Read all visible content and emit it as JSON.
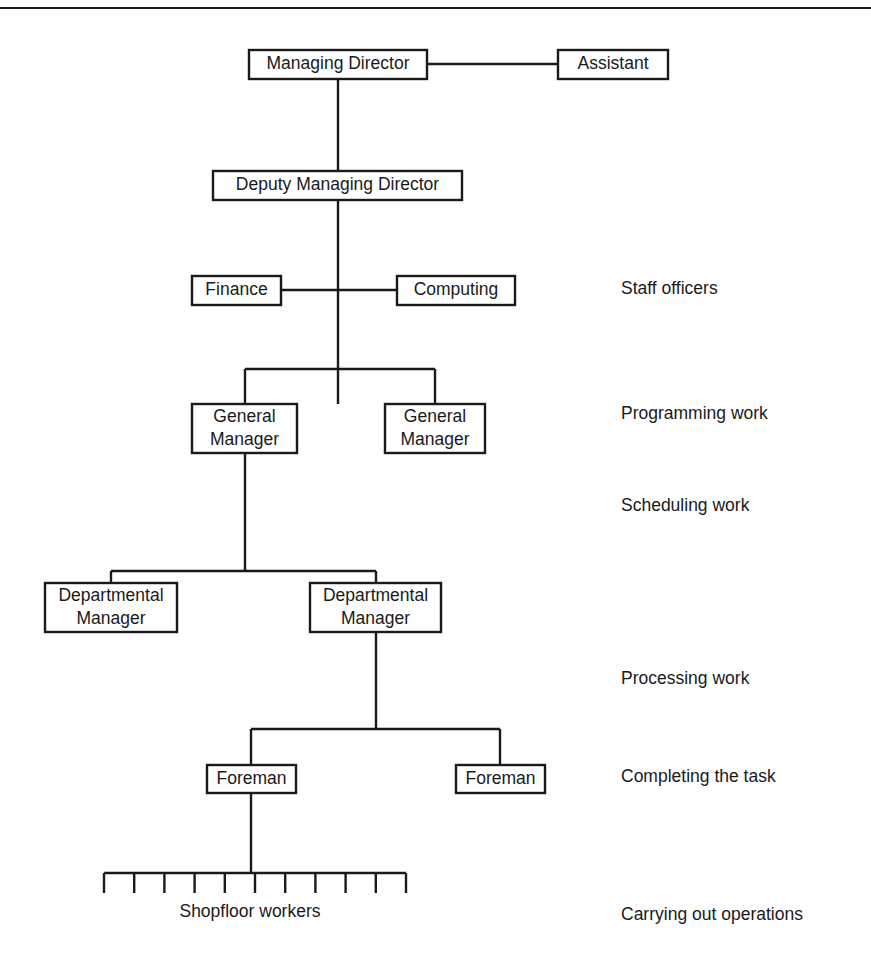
{
  "diagram": {
    "type": "organizational-chart",
    "background_color": "#ffffff",
    "line_color": "#1a1a1a",
    "text_color": "#1a1a1a",
    "top_rule": true,
    "nodes": [
      {
        "id": "managing-director",
        "label": "Managing Director",
        "lines": [
          "Managing Director"
        ],
        "x": 249,
        "y": 50,
        "w": 178,
        "h": 29,
        "level": 1
      },
      {
        "id": "assistant",
        "label": "Assistant",
        "lines": [
          "Assistant"
        ],
        "x": 558,
        "y": 50,
        "w": 110,
        "h": 29,
        "level": 1
      },
      {
        "id": "deputy-managing-director",
        "label": "Deputy Managing Director",
        "lines": [
          "Deputy Managing Director"
        ],
        "x": 213,
        "y": 171,
        "w": 249,
        "h": 29,
        "level": 2
      },
      {
        "id": "finance",
        "label": "Finance",
        "lines": [
          "Finance"
        ],
        "x": 192,
        "y": 276,
        "w": 89,
        "h": 29,
        "level": 3
      },
      {
        "id": "computing",
        "label": "Computing",
        "lines": [
          "Computing"
        ],
        "x": 397,
        "y": 276,
        "w": 118,
        "h": 29,
        "level": 3
      },
      {
        "id": "general-manager-1",
        "label": "General Manager",
        "lines": [
          "General",
          "Manager"
        ],
        "x": 192,
        "y": 404,
        "w": 105,
        "h": 49,
        "level": 4
      },
      {
        "id": "general-manager-2",
        "label": "General Manager",
        "lines": [
          "General",
          "Manager"
        ],
        "x": 385,
        "y": 404,
        "w": 100,
        "h": 49,
        "level": 4
      },
      {
        "id": "departmental-manager-1",
        "label": "Departmental Manager",
        "lines": [
          "Departmental",
          "Manager"
        ],
        "x": 45,
        "y": 583,
        "w": 132,
        "h": 49,
        "level": 5
      },
      {
        "id": "departmental-manager-2",
        "label": "Departmental Manager",
        "lines": [
          "Departmental",
          "Manager"
        ],
        "x": 310,
        "y": 583,
        "w": 131,
        "h": 49,
        "level": 5
      },
      {
        "id": "foreman-1",
        "label": "Foreman",
        "lines": [
          "Foreman"
        ],
        "x": 207,
        "y": 765,
        "w": 89,
        "h": 28,
        "level": 6
      },
      {
        "id": "foreman-2",
        "label": "Foreman",
        "lines": [
          "Foreman"
        ],
        "x": 456,
        "y": 765,
        "w": 89,
        "h": 28,
        "level": 6
      }
    ],
    "shopfloor": {
      "id": "shopfloor-workers",
      "caption": "Shopfloor workers",
      "caption_x": 250,
      "caption_y": 912,
      "bar_left": 104,
      "bar_right": 406,
      "bar_y": 873,
      "tick_count": 11,
      "tick_length": 20
    },
    "stage_labels": [
      {
        "id": "stage-staff-officers",
        "text": "Staff officers",
        "x": 621,
        "y": 289
      },
      {
        "id": "stage-programming-work",
        "text": "Programming work",
        "x": 621,
        "y": 414
      },
      {
        "id": "stage-scheduling-work",
        "text": "Scheduling work",
        "x": 621,
        "y": 506
      },
      {
        "id": "stage-processing-work",
        "text": "Processing work",
        "x": 621,
        "y": 679
      },
      {
        "id": "stage-completing-task",
        "text": "Completing the task",
        "x": 621,
        "y": 777
      },
      {
        "id": "stage-carrying-operations",
        "text": "Carrying out operations",
        "x": 621,
        "y": 915
      }
    ],
    "connectors": [
      {
        "id": "md-to-assistant",
        "points": "427,64 558,64"
      },
      {
        "id": "md-to-deputy",
        "points": "338,79 338,171"
      },
      {
        "id": "deputy-trunk-down",
        "points": "338,200 338,404"
      },
      {
        "id": "finance-to-trunk",
        "points": "281,290 338,290"
      },
      {
        "id": "trunk-to-computing",
        "points": "338,290 397,290"
      },
      {
        "id": "gm-split-bus",
        "points": "245,369 435,369"
      },
      {
        "id": "gm1-riser",
        "points": "245,369 245,404"
      },
      {
        "id": "gm2-riser",
        "points": "435,369 435,404"
      },
      {
        "id": "gm1-down-to-dm-bus",
        "points": "245,453 245,571"
      },
      {
        "id": "dm-split-bus",
        "points": "111,571 376,571"
      },
      {
        "id": "dm1-riser",
        "points": "111,571 111,583"
      },
      {
        "id": "dm2-riser",
        "points": "376,571 376,583"
      },
      {
        "id": "dm2-down-to-foreman-bus",
        "points": "376,632 376,729"
      },
      {
        "id": "foreman-split-bus",
        "points": "251,729 500,729"
      },
      {
        "id": "foreman1-riser",
        "points": "251,729 251,765"
      },
      {
        "id": "foreman2-riser",
        "points": "500,729 500,765"
      },
      {
        "id": "foreman1-down-to-shopfloor",
        "points": "251,793 251,873"
      }
    ],
    "rules": [
      {
        "id": "top-rule",
        "x1": 0,
        "y1": 8,
        "x2": 871,
        "y2": 8
      }
    ]
  }
}
